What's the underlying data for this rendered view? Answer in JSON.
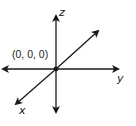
{
  "diagram": {
    "axes": {
      "x": {
        "label": "x"
      },
      "y": {
        "label": "y"
      },
      "z": {
        "label": "z"
      }
    },
    "origin": {
      "label": "(0, 0, 0)"
    },
    "colors": {
      "axis": "#1a1a1a",
      "text": "#222222",
      "background": "#ffffff"
    }
  }
}
